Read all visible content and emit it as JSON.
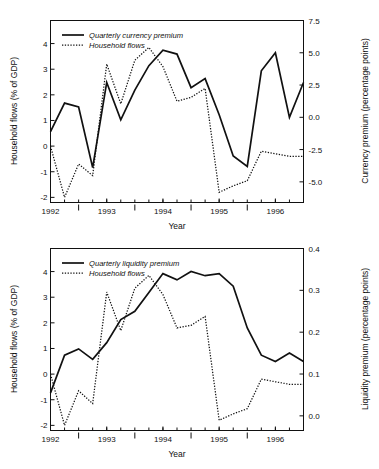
{
  "figure": {
    "title": "",
    "panels": [
      "currency_premium_panel",
      "liquidity_premium_panel"
    ]
  },
  "axes_text": {
    "left_axis_title": "Household flows (% of GDP)",
    "x_axis_title": "Year",
    "right_axis_title_top": "Currency premium (percentage points)",
    "right_axis_title_bottom": "Liquidity premium (percentage points)"
  },
  "legend_top": {
    "entry_solid": "Quarterly currency premium",
    "entry_dotted": "Household flows"
  },
  "legend_bottom": {
    "entry_solid": "Quarterly liquidity premium",
    "entry_dotted": "Household flows"
  },
  "x_tick_labels": [
    "1992",
    "1993",
    "1994",
    "1995",
    "1996"
  ],
  "left_tick_labels": [
    "4",
    "3",
    "2",
    "1",
    "0",
    "-1",
    "-2"
  ],
  "right_tick_labels_top": [
    "7.5",
    "5.0",
    "2.5",
    "0.0",
    "-2.5",
    "-5.0"
  ],
  "right_tick_labels_bottom": [
    "0.4",
    "0.3",
    "0.2",
    "0.1",
    "0.0"
  ],
  "colors": {
    "line": "#111111",
    "frame": "#111111",
    "background": "#ffffff"
  },
  "chart_data": [
    {
      "type": "line",
      "title": "",
      "xlabel": "Year",
      "ylabel": "Household flows (% of GDP)",
      "y2label": "Currency premium (percentage points)",
      "grid": false,
      "legend_position": "top-left",
      "xlim": [
        1992.0,
        1996.5
      ],
      "ylim": [
        -2.2,
        4.9
      ],
      "y2lim": [
        -6.6,
        7.5
      ],
      "xticks": [
        1992,
        1993,
        1994,
        1995,
        1996
      ],
      "yticks": [
        4,
        3,
        2,
        1,
        0,
        -1,
        -2
      ],
      "y2ticks": [
        7.5,
        5.0,
        2.5,
        0.0,
        -2.5,
        -5.0
      ],
      "x": [
        1992.0,
        1992.25,
        1992.5,
        1992.75,
        1993.0,
        1993.25,
        1993.5,
        1993.75,
        1994.0,
        1994.25,
        1994.5,
        1994.75,
        1995.0,
        1995.25,
        1995.5,
        1995.75,
        1996.0,
        1996.25,
        1996.5
      ],
      "series": [
        {
          "name": "Quarterly currency premium",
          "style": "solid",
          "axis": "right",
          "units": "percentage points",
          "values": [
            -1.1,
            1.1,
            0.8,
            -3.9,
            2.7,
            -0.2,
            2.1,
            4.0,
            5.2,
            4.9,
            2.3,
            3.0,
            0.2,
            -3.0,
            -3.8,
            3.6,
            5.0,
            0.0,
            2.7
          ]
        },
        {
          "name": "Household flows",
          "style": "dotted",
          "axis": "left",
          "units": "% of GDP",
          "values": [
            0.0,
            -2.0,
            -0.7,
            -1.15,
            3.2,
            1.65,
            3.35,
            3.85,
            3.1,
            1.75,
            1.9,
            2.25,
            -1.8,
            -1.55,
            -1.35,
            -0.2,
            -0.3,
            -0.4,
            -0.4
          ]
        }
      ]
    },
    {
      "type": "line",
      "title": "",
      "xlabel": "Year",
      "ylabel": "Household flows (% of GDP)",
      "y2label": "Liquidity premium (percentage points)",
      "grid": false,
      "legend_position": "top-left",
      "xlim": [
        1992.0,
        1996.5
      ],
      "ylim": [
        -2.2,
        4.9
      ],
      "y2lim": [
        -0.035,
        0.4
      ],
      "xticks": [
        1992,
        1993,
        1994,
        1995,
        1996
      ],
      "yticks": [
        4,
        3,
        2,
        1,
        0,
        -1,
        -2
      ],
      "y2ticks": [
        0.4,
        0.3,
        0.2,
        0.1,
        0.0
      ],
      "x": [
        1992.0,
        1992.25,
        1992.5,
        1992.75,
        1993.0,
        1993.25,
        1993.5,
        1993.75,
        1994.0,
        1994.25,
        1994.5,
        1994.75,
        1995.0,
        1995.25,
        1995.5,
        1995.75,
        1996.0,
        1996.25,
        1996.5
      ],
      "series": [
        {
          "name": "Quarterly liquidity premium",
          "style": "solid",
          "axis": "right",
          "units": "percentage points",
          "values": [
            0.055,
            0.145,
            0.16,
            0.135,
            0.175,
            0.23,
            0.25,
            0.295,
            0.34,
            0.325,
            0.345,
            0.335,
            0.34,
            0.31,
            0.21,
            0.145,
            0.13,
            0.15,
            0.13
          ]
        },
        {
          "name": "Household flows",
          "style": "dotted",
          "axis": "left",
          "units": "% of GDP",
          "values": [
            0.0,
            -2.0,
            -0.65,
            -1.15,
            3.2,
            1.7,
            3.35,
            3.85,
            3.1,
            1.8,
            1.9,
            2.25,
            -1.8,
            -1.55,
            -1.35,
            -0.2,
            -0.3,
            -0.4,
            -0.4
          ]
        }
      ]
    }
  ]
}
